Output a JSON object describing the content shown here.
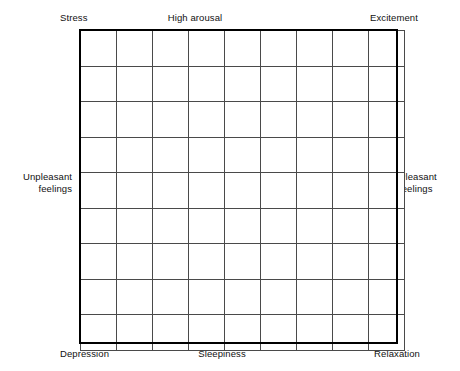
{
  "figure": {
    "name": "affect-grid",
    "background_color": "#ffffff",
    "text_color": "#111111",
    "outline_color": "#000000",
    "gridline_color": "#4a4a4a"
  },
  "chart_data": {
    "type": "table",
    "title": "",
    "subtitle": "",
    "xlabel": "",
    "ylabel": "",
    "grid": true,
    "columns": 9,
    "rows": 9,
    "cells_filled": 0,
    "legend": [],
    "annotations": [],
    "axis_labels": {
      "top_left": "Stress",
      "top_center": "High arousal",
      "top_right": "Excitement",
      "left_middle": "Unpleasant\nfeelings",
      "right_middle": "Pleasant\nfeelings",
      "bottom_left": "Depression",
      "bottom_center": "Sleepiness",
      "bottom_right": "Relaxation"
    }
  },
  "labels": {
    "top_left": "Stress",
    "top_center": "High arousal",
    "top_right": "Excitement",
    "left_middle": "Unpleasant\nfeelings",
    "right_middle": "Pleasant\nfeelings",
    "bottom_left": "Depression",
    "bottom_center": "Sleepiness",
    "bottom_right": "Relaxation"
  }
}
